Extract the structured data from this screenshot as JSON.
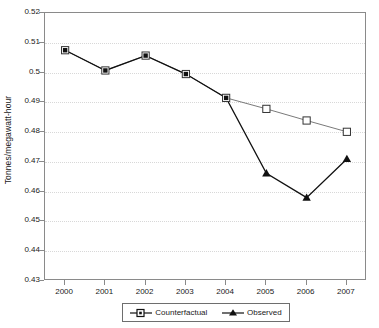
{
  "chart_data": {
    "type": "line",
    "title": "",
    "xlabel": "",
    "ylabel": "Tonnes/megawatt-hour",
    "categories": [
      "2000",
      "2001",
      "2002",
      "2003",
      "2004",
      "2005",
      "2006",
      "2007"
    ],
    "x": [
      2000,
      2001,
      2002,
      2003,
      2004,
      2005,
      2006,
      2007
    ],
    "ylim": [
      0.43,
      0.52
    ],
    "ytick_labels": [
      "0.52",
      "0.51",
      "0.5",
      "0.49",
      "0.48",
      "0.47",
      "0.46",
      "0.45",
      "0.44",
      "0.43"
    ],
    "ytick_values": [
      0.52,
      0.51,
      0.5,
      0.49,
      0.48,
      0.47,
      0.46,
      0.45,
      0.44,
      0.43
    ],
    "ytick_step": 0.01,
    "grid": true,
    "grid_axis": "y",
    "grid_style": "dotted",
    "legend_position": "bottom",
    "series": [
      {
        "name": "Counterfactual",
        "marker": "open-square",
        "color": "#7a7a7a",
        "x": [
          2000,
          2001,
          2002,
          2003,
          2004,
          2005,
          2006,
          2007
        ],
        "values": [
          0.5075,
          0.5007,
          0.5057,
          0.4995,
          0.4915,
          0.4878,
          0.4839,
          0.4801
        ]
      },
      {
        "name": "Observed",
        "marker": "filled-triangle",
        "color": "#111111",
        "x": [
          2000,
          2001,
          2002,
          2003,
          2004,
          2005,
          2006,
          2007
        ],
        "values": [
          0.5075,
          0.5007,
          0.5057,
          0.4995,
          0.4915,
          0.4662,
          0.458,
          0.471
        ]
      }
    ]
  },
  "legend": {
    "entries": [
      {
        "label": "Counterfactual",
        "marker": "open-square-marker"
      },
      {
        "label": "Observed",
        "marker": "filled-triangle-marker"
      }
    ]
  },
  "axes": {
    "y_title": "Tonnes/megawatt-hour"
  },
  "colors": {
    "counterfactual": "#7a7a7a",
    "observed": "#111111",
    "frame": "#8a8a8a",
    "gridline": "#d8d8d8",
    "background": "#ffffff"
  }
}
